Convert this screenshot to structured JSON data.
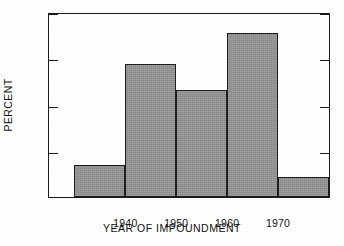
{
  "chart_data": {
    "type": "bar",
    "title": "",
    "subtitle": "",
    "xlabel": "YEAR OF IMPOUNDMENT",
    "ylabel": "PERCENT",
    "categories": [
      "1930-1940",
      "1940-1950",
      "1950-1960",
      "1960-1970",
      "1970-1980"
    ],
    "bin_edges": [
      1930,
      1940,
      1950,
      1960,
      1970,
      1980
    ],
    "values": [
      7.0,
      29.0,
      23.3,
      35.8,
      4.3
    ],
    "series": [
      {
        "name": "Percent of impoundments",
        "values": [
          7.0,
          29.0,
          23.3,
          35.8,
          4.3
        ]
      }
    ],
    "xlim": [
      1925,
      1980
    ],
    "ylim": [
      0,
      40
    ],
    "x_ticks": [
      1940,
      1950,
      1960,
      1970
    ],
    "x_tick_labels": [
      "1940",
      "1950",
      "1960",
      "1970"
    ],
    "y_ticks": [
      0,
      10,
      20,
      30,
      40
    ],
    "y_tick_labels": [
      "0",
      "10",
      "20",
      "30",
      "40"
    ],
    "grid": false,
    "legend": false,
    "legend_position": "none",
    "bar_fill_color": "#979797",
    "bar_edge_color": "#1d1d1d",
    "axis_color": "#1a1a1a",
    "background_color": "#ffffff"
  },
  "axes": {
    "y_tick_labels": [
      "40",
      "30",
      "20",
      "10",
      "0"
    ],
    "x_tick_labels": [
      "1940",
      "1950",
      "1960",
      "1970"
    ],
    "y_title": "PERCENT",
    "x_title": "YEAR OF IMPOUNDMENT"
  }
}
